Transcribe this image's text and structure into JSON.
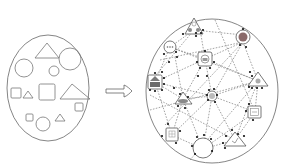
{
  "diagram": {
    "colors": {
      "stroke": "#555555",
      "light_stroke": "#777777",
      "dot": "#111111",
      "icon_fill": "#8a8a8a",
      "background": "#ffffff"
    },
    "left_group": {
      "label": "",
      "shapes": [
        {
          "type": "triangle",
          "x": 44,
          "y": 28,
          "size": 22
        },
        {
          "type": "circle",
          "cx": 70,
          "cy": 58,
          "r": 12
        },
        {
          "type": "circle",
          "cx": 24,
          "cy": 68,
          "r": 10
        },
        {
          "type": "circle",
          "cx": 54,
          "cy": 70,
          "r": 5
        },
        {
          "type": "square",
          "x": 12,
          "y": 88,
          "size": 10
        },
        {
          "type": "triangle",
          "x": 28,
          "y": 91,
          "size": 8
        },
        {
          "type": "square",
          "x": 40,
          "y": 84,
          "size": 17
        },
        {
          "type": "triangle",
          "x": 66,
          "y": 84,
          "size": 24
        },
        {
          "type": "square",
          "x": 76,
          "y": 103,
          "size": 8
        },
        {
          "type": "square",
          "x": 27,
          "y": 114,
          "size": 7
        },
        {
          "type": "circle",
          "cx": 43,
          "cy": 124,
          "r": 7
        },
        {
          "type": "triangle",
          "x": 57,
          "y": 113,
          "size": 8
        }
      ]
    },
    "arrow": {
      "direction": "right"
    },
    "right_group": {
      "label": "",
      "nodes": [
        {
          "name": "triangle-node-top",
          "icon": "group-triangle",
          "x": 194,
          "y": 26
        },
        {
          "name": "circle-node-top-right",
          "icon": "circle-red",
          "x": 243,
          "y": 37
        },
        {
          "name": "circle-node-left",
          "icon": "chat-circle",
          "x": 170,
          "y": 47
        },
        {
          "name": "pentagon-node-center",
          "icon": "robot-pentagon",
          "x": 205,
          "y": 59
        },
        {
          "name": "square-node-left",
          "icon": "robot-square",
          "x": 155,
          "y": 82
        },
        {
          "name": "triangle-node-right",
          "icon": "people-triangle",
          "x": 258,
          "y": 81
        },
        {
          "name": "triangle-node-mid-left",
          "icon": "cloud-triangle",
          "x": 183,
          "y": 99
        },
        {
          "name": "circle-node-center",
          "icon": "gear-circle",
          "x": 212,
          "y": 96
        },
        {
          "name": "square-node-right",
          "icon": "chart-square",
          "x": 255,
          "y": 112
        },
        {
          "name": "square-node-bottom-left",
          "icon": "grid-square",
          "x": 172,
          "y": 135
        },
        {
          "name": "circle-node-bottom",
          "icon": "empty-circle",
          "x": 203,
          "y": 149
        },
        {
          "name": "triangle-node-bottom-right",
          "icon": "check-triangle",
          "x": 235,
          "y": 140
        }
      ]
    }
  }
}
